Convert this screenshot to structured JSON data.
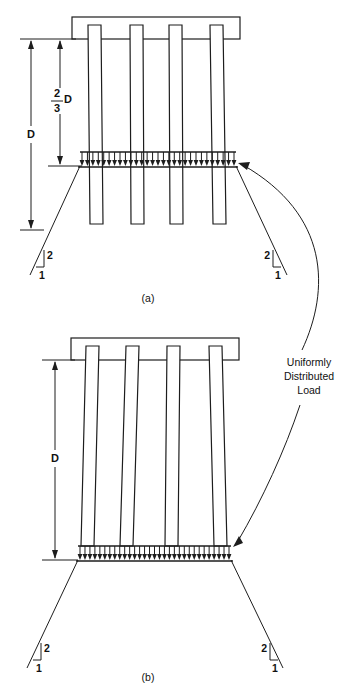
{
  "figure": {
    "background_color": "#ffffff",
    "line_color": "#1d1d1d"
  },
  "annotations": {
    "load_label_line1": "Uniformly",
    "load_label_line2": "Distributed",
    "load_label_line3": "Load"
  },
  "panel_a": {
    "caption": "(a)",
    "dimensions": {
      "overall_label": "D",
      "partial_numerator": "2",
      "partial_denominator": "3",
      "partial_suffix": "D"
    },
    "slope_left": {
      "vertical": "2",
      "horizontal": "1"
    },
    "slope_right": {
      "vertical": "2",
      "horizontal": "1"
    },
    "pile_count": 4,
    "arrow_count": 29
  },
  "panel_b": {
    "caption": "(b)",
    "dimensions": {
      "overall_label": "D"
    },
    "slope_left": {
      "vertical": "2",
      "horizontal": "1"
    },
    "slope_right": {
      "vertical": "2",
      "horizontal": "1"
    },
    "pile_count": 4,
    "arrow_count": 31
  }
}
